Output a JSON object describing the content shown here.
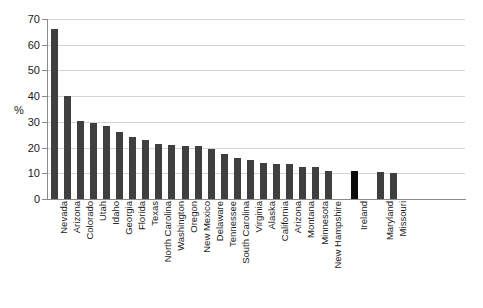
{
  "chart_data": {
    "type": "bar",
    "title": "",
    "xlabel": "",
    "ylabel": "%",
    "ylim": [
      0,
      70
    ],
    "ytick_labels": [
      "0",
      "10",
      "20",
      "30",
      "40",
      "50",
      "60",
      "70"
    ],
    "ytick_values": [
      0,
      10,
      20,
      30,
      40,
      50,
      60,
      70
    ],
    "grid": true,
    "legend": false,
    "categories": [
      "Nevada",
      "Arizona",
      "Colorado",
      "Utah",
      "Idaho",
      "Georgia",
      "Florida",
      "Texas",
      "North Carolina",
      "Washington",
      "Oregon",
      "New Mexico",
      "Delaware",
      "Tennessee",
      "South Carolina",
      "Virginia",
      "Alaska",
      "California",
      "Arizona",
      "Montana",
      "Minnesota",
      "New Hampshire",
      "Ireland",
      "Maryland",
      "Missouri"
    ],
    "values": [
      66,
      40,
      30.5,
      29.5,
      28.5,
      26,
      24,
      23,
      21.5,
      21,
      20.5,
      20.5,
      19.5,
      17.5,
      16,
      15,
      14,
      13.5,
      13.5,
      12.5,
      12.5,
      11,
      11,
      10.5,
      10
    ],
    "highlight_category": "Ireland",
    "gap_before": [
      "Ireland",
      "Maryland"
    ],
    "colors": {
      "bar": "#3f3f3f",
      "bar_highlight": "#0a0a0a",
      "grid": "#d4d4d4",
      "axis": "#8a8a8a",
      "text": "#1a1a1a",
      "background": "#ffffff"
    }
  }
}
